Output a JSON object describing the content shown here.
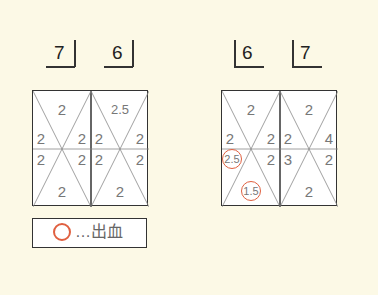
{
  "upper_left": {
    "teeth": [
      {
        "label": "7",
        "side": "left-quadrant"
      },
      {
        "label": "6",
        "side": "left-quadrant"
      }
    ],
    "chart": {
      "tooth_7": {
        "top": "2",
        "mid_left_upper": "2",
        "mid_right_upper": "2",
        "mid_left_lower": "2",
        "mid_right_lower": "2",
        "bottom": "2"
      },
      "tooth_6": {
        "top": "2.5",
        "mid_left_upper": "2",
        "mid_right_upper": "2",
        "mid_left_lower": "2",
        "mid_right_lower": "2",
        "bottom": "2"
      }
    }
  },
  "upper_right": {
    "teeth": [
      {
        "label": "6",
        "side": "right-quadrant"
      },
      {
        "label": "7",
        "side": "right-quadrant"
      }
    ],
    "chart": {
      "tooth_6": {
        "top": "2",
        "mid_left_upper": "2",
        "mid_right_upper": "2",
        "mid_left_lower": "2.5",
        "mid_right_lower": "2",
        "bottom": "1.5"
      },
      "tooth_7": {
        "top": "2",
        "mid_left_upper": "2",
        "mid_right_upper": "4",
        "mid_left_lower": "3",
        "mid_right_lower": "2",
        "bottom": "2"
      }
    },
    "bleeding_sites": [
      "tooth_6.mid_left_lower",
      "tooth_6.bottom"
    ]
  },
  "legend": {
    "symbol": "circle",
    "text": "…出血"
  },
  "colors": {
    "background": "#fcf9e6",
    "bleeding": "#e06040",
    "lines": "#333333",
    "values": "#777777"
  }
}
